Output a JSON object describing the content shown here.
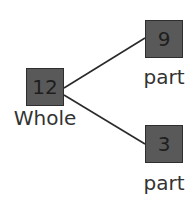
{
  "diagram": {
    "type": "part-part-whole",
    "whole": {
      "value": "12",
      "label": "Whole"
    },
    "parts": [
      {
        "value": "9",
        "label": "part"
      },
      {
        "value": "3",
        "label": "part"
      }
    ],
    "colors": {
      "box_fill": "#595959",
      "box_border": "#2e2e2e",
      "line": "#2a2a2a",
      "text": "#333333"
    }
  }
}
